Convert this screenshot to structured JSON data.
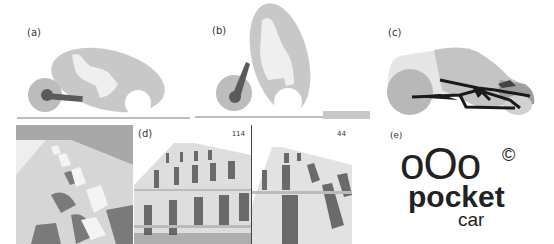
{
  "figure": {
    "panels": [
      {
        "id": "a",
        "label": "(a)",
        "description": "Reclined rider in pod vehicle, side view"
      },
      {
        "id": "b",
        "label": "(b)",
        "description": "Upright rider in pod vehicle, side view"
      },
      {
        "id": "c",
        "label": "(c)",
        "description": "3D rendering of pocket car with frame structure"
      },
      {
        "id": "d",
        "label": "(d)",
        "description": "Rendered rows of parked pocket cars",
        "views": [
          {
            "counter": ""
          },
          {
            "counter": "114"
          },
          {
            "counter": "44"
          }
        ]
      },
      {
        "id": "e",
        "label": "(e)",
        "description": "Logo"
      }
    ],
    "logo": {
      "circles": "oOo",
      "word": "pocket",
      "sub": "car",
      "mark": "©"
    },
    "colors": {
      "body_gray": "#c8c8c8",
      "dark_gray": "#5a5a5a",
      "wheel_gray": "#b4b4b4",
      "ground": "#bdbdbd",
      "black": "#1a1a1a"
    }
  }
}
